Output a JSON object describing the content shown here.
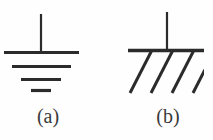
{
  "figure": {
    "background_color": "#fefefe",
    "stroke_color": "#2b2b2b",
    "caption_color": "#3a3a3a",
    "panels": [
      {
        "id": "a",
        "caption": "(a)",
        "symbol_name": "earth-ground-symbol",
        "description": "Earth ground: vertical stem meeting a stack of four horizontal bars of decreasing width",
        "stem": {
          "x": 41,
          "y_top": 14,
          "y_bottom": 52,
          "width": 2
        },
        "bars": [
          {
            "x1": 4,
            "x2": 79,
            "y": 52,
            "thickness": 3
          },
          {
            "x1": 12,
            "x2": 71,
            "y": 66,
            "thickness": 3
          },
          {
            "x1": 21,
            "x2": 61,
            "y": 79,
            "thickness": 3
          },
          {
            "x1": 31,
            "x2": 51,
            "y": 90,
            "thickness": 3
          }
        ]
      },
      {
        "id": "b",
        "caption": "(b)",
        "symbol_name": "chassis-ground-symbol",
        "description": "Chassis ground: vertical stem meeting a single horizontal bar with four 45-degree hatch lines below",
        "stem": {
          "x": 167,
          "y_top": 12,
          "y_bottom": 50,
          "width": 2
        },
        "bars": [
          {
            "x1": 128,
            "x2": 204,
            "y": 50,
            "thickness": 3
          }
        ],
        "hatch_lines": [
          {
            "x1": 152,
            "y1": 51,
            "x2": 131,
            "y2": 92
          },
          {
            "x1": 173,
            "y1": 51,
            "x2": 152,
            "y2": 92
          },
          {
            "x1": 194,
            "y1": 51,
            "x2": 173,
            "y2": 92
          },
          {
            "x1": 214,
            "y1": 51,
            "x2": 193,
            "y2": 92
          }
        ]
      }
    ]
  }
}
